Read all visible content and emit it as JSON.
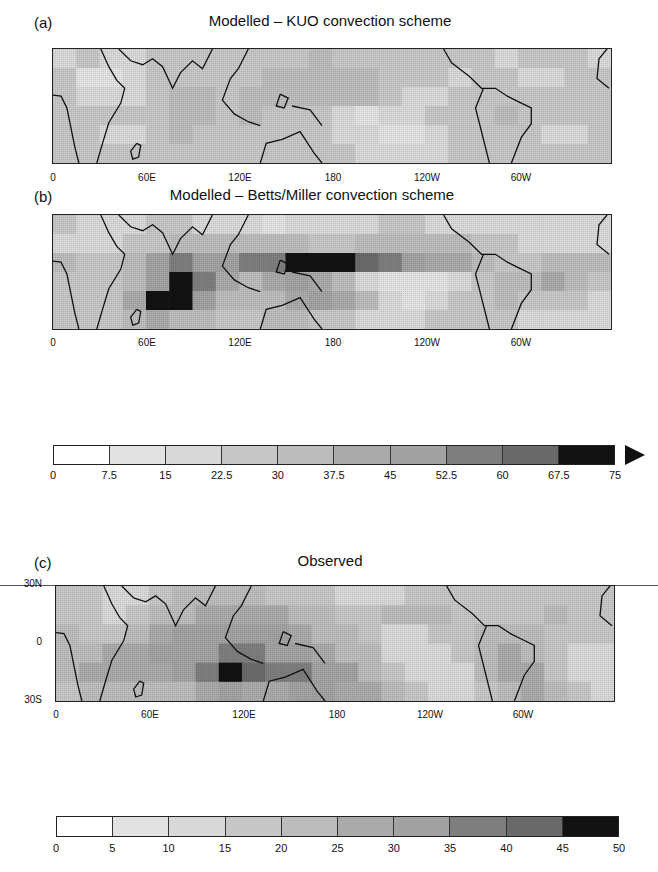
{
  "chart_data": [
    {
      "type": "heatmap",
      "id": "a",
      "panel_label": "(a)",
      "title": "Modelled – KUO convection scheme",
      "x_ticks": [
        "0",
        "60E",
        "120E",
        "180",
        "120W",
        "60W"
      ],
      "y_ticks": [],
      "domain": {
        "lon": [
          0,
          360
        ],
        "lat": [
          -30,
          30
        ]
      },
      "colorbar": "scale_1",
      "description": "Fairly uniform moderate values (~15-37.5) across tropics; no strong ITCZ/SPCZ maxima; lighter patches over eastern Pacific and Arabian Sea."
    },
    {
      "type": "heatmap",
      "id": "b",
      "panel_label": "(b)",
      "title": "Modelled – Betts/Miller convection scheme",
      "x_ticks": [
        "0",
        "60E",
        "120E",
        "180",
        "120W",
        "60W"
      ],
      "y_ticks": [],
      "domain": {
        "lon": [
          0,
          360
        ],
        "lat": [
          -30,
          30
        ]
      },
      "colorbar": "scale_1",
      "description": "Strong maxima (>67.5) over central Indian Ocean and a band along ~5N from 140E to 160W; low values over SE Pacific."
    },
    {
      "type": "heatmap",
      "id": "c",
      "panel_label": "(c)",
      "title": "Observed",
      "x_ticks": [
        "0",
        "60E",
        "120E",
        "180",
        "120W",
        "60W"
      ],
      "y_ticks": [
        "30N",
        "0",
        "30S"
      ],
      "domain": {
        "lon": [
          0,
          360
        ],
        "lat": [
          -30,
          30
        ]
      },
      "colorbar": "scale_2",
      "description": "Broad maximum over Maritime Continent and SPCZ extending SE from 120E to 150W; peak (>45) near 120-135E, 15S; lower values in SE Pacific and South Atlantic."
    }
  ],
  "scale_1": {
    "labels": [
      "0",
      "7.5",
      "15",
      "22.5",
      "30",
      "37.5",
      "45",
      "52.5",
      "60",
      "67.5",
      "75"
    ],
    "colors": [
      "#ffffff",
      "#e2e2e2",
      "#d8d8d8",
      "#c6c6c6",
      "#bcbcbc",
      "#aaaaaa",
      "#a2a2a2",
      "#7e7e7e",
      "#6a6a6a",
      "#121212"
    ],
    "extend": "max"
  },
  "scale_2": {
    "labels": [
      "0",
      "5",
      "10",
      "15",
      "20",
      "25",
      "30",
      "35",
      "40",
      "45",
      "50"
    ],
    "colors": [
      "#ffffff",
      "#e2e2e2",
      "#d8d8d8",
      "#c6c6c6",
      "#bcbcbc",
      "#aaaaaa",
      "#a2a2a2",
      "#7e7e7e",
      "#6a6a6a",
      "#121212"
    ],
    "extend": "none"
  },
  "fields": {
    "a": [
      [
        0.28,
        0.3,
        0.22,
        0.26,
        0.3,
        0.34,
        0.32,
        0.3,
        0.34,
        0.36,
        0.38,
        0.4,
        0.38,
        0.34,
        0.3,
        0.34,
        0.38,
        0.34,
        0.3,
        0.26,
        0.3,
        0.34,
        0.3,
        0.28
      ],
      [
        0.3,
        0.18,
        0.1,
        0.24,
        0.3,
        0.3,
        0.34,
        0.36,
        0.38,
        0.4,
        0.44,
        0.46,
        0.48,
        0.4,
        0.36,
        0.34,
        0.3,
        0.28,
        0.34,
        0.3,
        0.24,
        0.28,
        0.3,
        0.3
      ],
      [
        0.32,
        0.26,
        0.2,
        0.26,
        0.36,
        0.4,
        0.4,
        0.38,
        0.4,
        0.42,
        0.42,
        0.4,
        0.4,
        0.42,
        0.36,
        0.26,
        0.26,
        0.36,
        0.38,
        0.36,
        0.34,
        0.34,
        0.32,
        0.3
      ],
      [
        0.34,
        0.34,
        0.3,
        0.3,
        0.38,
        0.42,
        0.4,
        0.36,
        0.4,
        0.38,
        0.36,
        0.32,
        0.22,
        0.18,
        0.2,
        0.24,
        0.3,
        0.34,
        0.38,
        0.4,
        0.34,
        0.3,
        0.3,
        0.32
      ],
      [
        0.34,
        0.32,
        0.26,
        0.28,
        0.34,
        0.4,
        0.38,
        0.34,
        0.34,
        0.36,
        0.34,
        0.32,
        0.28,
        0.22,
        0.14,
        0.16,
        0.22,
        0.3,
        0.34,
        0.36,
        0.32,
        0.26,
        0.24,
        0.3
      ],
      [
        0.36,
        0.36,
        0.32,
        0.32,
        0.36,
        0.38,
        0.36,
        0.32,
        0.3,
        0.32,
        0.34,
        0.32,
        0.3,
        0.26,
        0.22,
        0.24,
        0.28,
        0.32,
        0.34,
        0.34,
        0.32,
        0.3,
        0.32,
        0.34
      ]
    ],
    "b": [
      [
        0.3,
        0.28,
        0.24,
        0.26,
        0.3,
        0.3,
        0.28,
        0.24,
        0.2,
        0.18,
        0.2,
        0.22,
        0.24,
        0.26,
        0.3,
        0.3,
        0.28,
        0.26,
        0.24,
        0.26,
        0.28,
        0.26,
        0.26,
        0.28
      ],
      [
        0.28,
        0.26,
        0.24,
        0.3,
        0.36,
        0.42,
        0.4,
        0.44,
        0.48,
        0.46,
        0.4,
        0.36,
        0.34,
        0.4,
        0.44,
        0.48,
        0.46,
        0.42,
        0.36,
        0.3,
        0.28,
        0.28,
        0.28,
        0.28
      ],
      [
        0.4,
        0.34,
        0.3,
        0.42,
        0.62,
        0.72,
        0.62,
        0.64,
        0.7,
        0.78,
        0.96,
        1.0,
        1.0,
        0.86,
        0.72,
        0.6,
        0.52,
        0.5,
        0.44,
        0.38,
        0.36,
        0.4,
        0.44,
        0.4
      ],
      [
        0.36,
        0.34,
        0.36,
        0.48,
        0.66,
        0.96,
        0.72,
        0.54,
        0.44,
        0.5,
        0.62,
        0.58,
        0.4,
        0.26,
        0.18,
        0.16,
        0.18,
        0.28,
        0.34,
        0.4,
        0.46,
        0.5,
        0.42,
        0.34
      ],
      [
        0.3,
        0.32,
        0.36,
        0.5,
        0.96,
        0.94,
        0.68,
        0.42,
        0.4,
        0.48,
        0.58,
        0.64,
        0.54,
        0.4,
        0.22,
        0.16,
        0.2,
        0.3,
        0.36,
        0.4,
        0.38,
        0.34,
        0.3,
        0.28
      ],
      [
        0.3,
        0.3,
        0.34,
        0.42,
        0.5,
        0.48,
        0.42,
        0.36,
        0.38,
        0.42,
        0.4,
        0.36,
        0.32,
        0.28,
        0.26,
        0.26,
        0.3,
        0.32,
        0.34,
        0.32,
        0.28,
        0.26,
        0.26,
        0.28
      ]
    ],
    "c": [
      [
        0.34,
        0.3,
        0.24,
        0.28,
        0.34,
        0.4,
        0.42,
        0.4,
        0.4,
        0.38,
        0.36,
        0.32,
        0.26,
        0.24,
        0.26,
        0.3,
        0.34,
        0.36,
        0.34,
        0.3,
        0.3,
        0.34,
        0.34,
        0.32
      ],
      [
        0.36,
        0.3,
        0.22,
        0.3,
        0.4,
        0.48,
        0.5,
        0.52,
        0.56,
        0.54,
        0.48,
        0.4,
        0.36,
        0.38,
        0.44,
        0.48,
        0.42,
        0.36,
        0.34,
        0.36,
        0.38,
        0.4,
        0.36,
        0.34
      ],
      [
        0.4,
        0.34,
        0.3,
        0.46,
        0.56,
        0.62,
        0.66,
        0.66,
        0.64,
        0.6,
        0.52,
        0.44,
        0.4,
        0.32,
        0.28,
        0.26,
        0.3,
        0.36,
        0.44,
        0.48,
        0.44,
        0.36,
        0.3,
        0.32
      ],
      [
        0.42,
        0.44,
        0.5,
        0.58,
        0.62,
        0.64,
        0.66,
        0.72,
        0.72,
        0.66,
        0.66,
        0.58,
        0.48,
        0.4,
        0.28,
        0.2,
        0.22,
        0.3,
        0.44,
        0.52,
        0.48,
        0.36,
        0.26,
        0.26
      ],
      [
        0.4,
        0.56,
        0.58,
        0.54,
        0.58,
        0.62,
        0.72,
        0.98,
        0.84,
        0.74,
        0.72,
        0.66,
        0.6,
        0.48,
        0.36,
        0.24,
        0.22,
        0.26,
        0.4,
        0.58,
        0.52,
        0.36,
        0.26,
        0.22
      ],
      [
        0.36,
        0.44,
        0.42,
        0.4,
        0.44,
        0.48,
        0.5,
        0.6,
        0.58,
        0.56,
        0.6,
        0.62,
        0.58,
        0.5,
        0.42,
        0.32,
        0.26,
        0.28,
        0.36,
        0.46,
        0.52,
        0.44,
        0.3,
        0.26
      ]
    ]
  }
}
